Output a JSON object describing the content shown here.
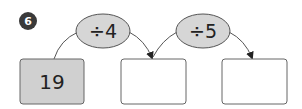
{
  "problem": {
    "number": "6",
    "start_value": "19",
    "steps": [
      {
        "operation": "÷4"
      },
      {
        "operation": "÷5"
      }
    ],
    "answer_boxes": [
      "",
      ""
    ]
  },
  "colors": {
    "badge": "#3a3a3a",
    "start_box_fill": "#d0d0d0",
    "ellipse_fill": "#d6d6d6",
    "stroke": "#555555"
  }
}
